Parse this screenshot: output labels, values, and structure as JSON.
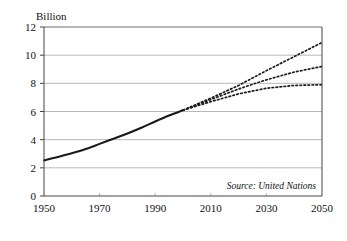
{
  "chart_data": {
    "type": "line",
    "title": "",
    "subtitle": "",
    "unit_label": "Billion",
    "xlabel": "",
    "ylabel": "",
    "source_note": "Source: United Nations",
    "xlim": [
      1950,
      2050
    ],
    "ylim": [
      0,
      12
    ],
    "xticks": [
      1950,
      1970,
      1990,
      2010,
      2030,
      2050
    ],
    "xtick_labels": [
      "1950",
      "1970",
      "1990",
      "2010",
      "2030",
      "2050"
    ],
    "yticks": [
      0,
      2,
      4,
      6,
      8,
      10,
      12
    ],
    "ytick_labels": [
      "0",
      "2",
      "4",
      "6",
      "8",
      "10",
      "12"
    ],
    "grid": "horizontal",
    "legend": "none",
    "series": [
      {
        "name": "Historical population",
        "style": "solid",
        "color": "#1a1a1a",
        "x": [
          1950,
          1955,
          1960,
          1965,
          1970,
          1975,
          1980,
          1985,
          1990,
          1995,
          2000
        ],
        "values": [
          2.53,
          2.77,
          3.03,
          3.33,
          3.7,
          4.07,
          4.44,
          4.85,
          5.29,
          5.71,
          6.09
        ]
      },
      {
        "name": "High projection",
        "style": "dotted",
        "color": "#1a1a1a",
        "x": [
          2000,
          2010,
          2020,
          2030,
          2040,
          2050
        ],
        "values": [
          6.09,
          6.95,
          7.85,
          8.9,
          9.9,
          10.9
        ]
      },
      {
        "name": "Medium projection",
        "style": "dotted",
        "color": "#1a1a1a",
        "x": [
          2000,
          2010,
          2020,
          2030,
          2040,
          2050
        ],
        "values": [
          6.09,
          6.85,
          7.6,
          8.25,
          8.8,
          9.2
        ]
      },
      {
        "name": "Low projection",
        "style": "dotted",
        "color": "#1a1a1a",
        "x": [
          2000,
          2010,
          2020,
          2030,
          2040,
          2050
        ],
        "values": [
          6.09,
          6.7,
          7.25,
          7.65,
          7.85,
          7.9
        ]
      }
    ],
    "colors": {
      "line": "#1a1a1a",
      "grid": "#b8b8b8",
      "frame": "#444444",
      "background": "#ffffff",
      "text": "#111111"
    }
  }
}
